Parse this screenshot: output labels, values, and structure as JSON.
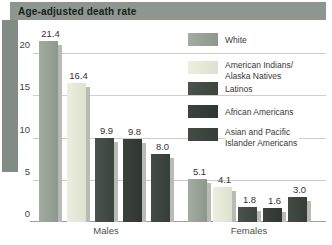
{
  "title": "Age-adjusted death rate",
  "chart_data": {
    "type": "bar",
    "title": "Age-adjusted death rate",
    "categories": [
      "Males",
      "Females"
    ],
    "series": [
      {
        "name": "White",
        "legend_lines": [
          "White"
        ],
        "values": [
          21.4,
          5.1
        ],
        "color": "#a3ac9f",
        "color2": "#8d978e"
      },
      {
        "name": "American Indians/Alaska Natives",
        "legend_lines": [
          "American Indians/",
          "Alaska Natives"
        ],
        "values": [
          16.4,
          4.1
        ],
        "color": "#ecefdf",
        "color2": "#dde1cf"
      },
      {
        "name": "Latinos",
        "legend_lines": [
          "Latinos"
        ],
        "values": [
          9.9,
          1.8
        ],
        "color": "#4a524b",
        "color2": "#3c443e"
      },
      {
        "name": "African Americans",
        "legend_lines": [
          "African Americans"
        ],
        "values": [
          9.8,
          1.6
        ],
        "color": "#3b423c",
        "color2": "#2f3631"
      },
      {
        "name": "Asian and Pacific Islander Americans",
        "legend_lines": [
          "Asian and Pacific",
          "Islander Americans"
        ],
        "values": [
          8.0,
          3.0
        ],
        "color": "#434b44",
        "color2": "#363e38"
      }
    ],
    "ylim": [
      0,
      22.5
    ],
    "yticks": [
      0,
      5,
      10,
      15,
      20
    ],
    "grid": true,
    "legend_position": "right",
    "bar_shadow_color": "#b8bbb3",
    "banner_color": "#8d968f",
    "band_color": "#828c85"
  }
}
